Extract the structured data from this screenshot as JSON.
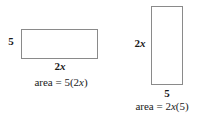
{
  "figure": {
    "background_color": "#ffffff",
    "stroke_color": "#8a8a8a",
    "text_color": "#1a1a1a"
  },
  "left_figure": {
    "name": "horizontal-rectangle",
    "orientation": "horizontal",
    "height_label": "5",
    "width_label_coefficient": "2",
    "width_label_variable": "x",
    "area_prefix": "area = ",
    "area_expression_parts": {
      "factor1": "5",
      "open_paren": "(",
      "factor2_coefficient": "2",
      "factor2_variable": "x",
      "close_paren": ")"
    },
    "area_expression_full": "area = 5(2x)"
  },
  "right_figure": {
    "name": "vertical-rectangle",
    "orientation": "vertical",
    "height_label_coefficient": "2",
    "height_label_variable": "x",
    "width_label": "5",
    "area_prefix": "area = ",
    "area_expression_parts": {
      "factor1_coefficient": "2",
      "factor1_variable": "x",
      "open_paren": "(",
      "factor2": "5",
      "close_paren": ")"
    },
    "area_expression_full": "area = 2x(5)"
  }
}
